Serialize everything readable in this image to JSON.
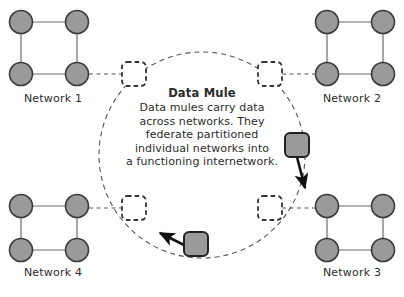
{
  "diagram": {
    "colors": {
      "node_fill": "#9a9a9a",
      "node_stroke": "#3a3a3a",
      "mule_fill": "#9a9a9a",
      "mule_stroke": "#222222",
      "link": "#6e6e6e",
      "dashed": "#555555",
      "text": "#2b2b2b",
      "background": "#ffffff"
    },
    "center": {
      "title": "Data Mule",
      "body_lines": [
        "Data mules carry data",
        "across networks. They",
        "federate partitioned",
        "individual networks into",
        "a functioning internetwork."
      ]
    },
    "networks": [
      {
        "id": "net1",
        "label": "Network 1",
        "corner": "top-left",
        "nodes": 4
      },
      {
        "id": "net2",
        "label": "Network 2",
        "corner": "top-right",
        "nodes": 4
      },
      {
        "id": "net3",
        "label": "Network 3",
        "corner": "bottom-right",
        "nodes": 4
      },
      {
        "id": "net4",
        "label": "Network 4",
        "corner": "bottom-left",
        "nodes": 4
      }
    ],
    "gateways": [
      {
        "id": "gw-top-left",
        "shape": "dashed-rounded-square"
      },
      {
        "id": "gw-top-right",
        "shape": "dashed-rounded-square"
      },
      {
        "id": "gw-bottom-left",
        "shape": "dashed-rounded-square"
      },
      {
        "id": "gw-bottom-right",
        "shape": "dashed-rounded-square"
      }
    ],
    "mules": [
      {
        "id": "mule-right",
        "shape": "rounded-square",
        "direction": "down"
      },
      {
        "id": "mule-bottom",
        "shape": "rounded-square",
        "direction": "up-left"
      }
    ],
    "orbit": {
      "shape": "dashed-circle",
      "cx": 202,
      "cy": 155,
      "r": 103
    }
  }
}
